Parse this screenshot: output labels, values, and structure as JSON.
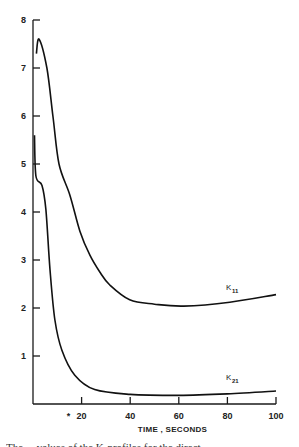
{
  "chart_data": {
    "type": "line",
    "title": "",
    "xlabel": "TIME , SECONDS",
    "ylabel": "",
    "xlim": [
      0,
      100
    ],
    "ylim": [
      0,
      8
    ],
    "grid": false,
    "legend": "inline labels at right end of curves",
    "x_ticks": [
      20,
      40,
      60,
      80,
      100
    ],
    "x_tick_labels": [
      "20",
      "40",
      "60",
      "80",
      "100"
    ],
    "x_annotation": "*",
    "y_ticks": [
      1,
      2,
      3,
      4,
      5,
      6,
      7,
      8
    ],
    "y_tick_labels": [
      "1",
      "2",
      "3",
      "4",
      "5",
      "6",
      "7",
      "8"
    ],
    "series": [
      {
        "name": "K11",
        "label_main": "K",
        "label_sub": "11",
        "points": [
          [
            1.4,
            7.3
          ],
          [
            2.5,
            7.6
          ],
          [
            5.7,
            7.0
          ],
          [
            8.2,
            6.0
          ],
          [
            10.7,
            5.0
          ],
          [
            15.2,
            4.35
          ],
          [
            19.3,
            3.6
          ],
          [
            23.4,
            3.1
          ],
          [
            27.5,
            2.75
          ],
          [
            31.6,
            2.48
          ],
          [
            39.8,
            2.17
          ],
          [
            50,
            2.08
          ],
          [
            62,
            2.04
          ],
          [
            81,
            2.12
          ],
          [
            100,
            2.28
          ]
        ]
      },
      {
        "name": "K21",
        "label_main": "K",
        "label_sub": "21",
        "points": [
          [
            0.6,
            5.6
          ],
          [
            1.2,
            4.75
          ],
          [
            3.7,
            4.55
          ],
          [
            5.3,
            4.05
          ],
          [
            7,
            2.8
          ],
          [
            9,
            1.75
          ],
          [
            11.9,
            1.12
          ],
          [
            17.2,
            0.6
          ],
          [
            25.4,
            0.3
          ],
          [
            40,
            0.2
          ],
          [
            60,
            0.18
          ],
          [
            80,
            0.21
          ],
          [
            100,
            0.27
          ]
        ]
      }
    ]
  },
  "caption": "The ... values of the K-profiles for the direct"
}
